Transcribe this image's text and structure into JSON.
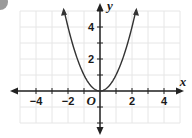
{
  "chart_data": {
    "type": "line",
    "title": "",
    "function": "y = x^2",
    "xlabel": "x",
    "ylabel": "y",
    "origin_label": "O",
    "xlim": [
      -5,
      5
    ],
    "ylim": [
      -3,
      5.5
    ],
    "x_ticks": [
      -4,
      -2,
      2,
      4
    ],
    "y_ticks": [
      2,
      4
    ],
    "x_tick_labels": [
      "−4",
      "−2",
      "2",
      "4"
    ],
    "y_tick_labels": [
      "2",
      "4"
    ],
    "grid": true,
    "series": [
      {
        "name": "y = x^2",
        "x": [
          -2.3,
          -2,
          -1.5,
          -1,
          -0.5,
          0,
          0.5,
          1,
          1.5,
          2,
          2.3
        ],
        "y": [
          5.29,
          4,
          2.25,
          1,
          0.25,
          0,
          0.25,
          1,
          2.25,
          4,
          5.29
        ]
      }
    ],
    "colors": {
      "curve": "#333333",
      "axis": "#222222",
      "grid": "#e6e6e6"
    }
  }
}
